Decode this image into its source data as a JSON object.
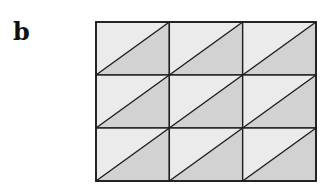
{
  "panel_label": "b",
  "diagram": {
    "rows": 3,
    "cols": 3,
    "diagonal": "bottom-left-to-top-right",
    "colors": {
      "light_triangle": "#ebebeb",
      "dark_triangle": "#d2d2d2",
      "stroke": "#1e1e1e"
    }
  }
}
